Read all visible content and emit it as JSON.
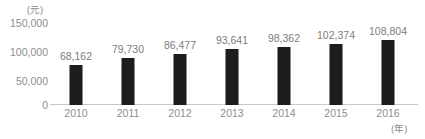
{
  "chart_data": {
    "type": "bar",
    "title": "",
    "subtitle": "",
    "xlabel": "(年)",
    "ylabel": "(元)",
    "categories": [
      "2010",
      "2011",
      "2012",
      "2013",
      "2014",
      "2015",
      "2016"
    ],
    "values": [
      68162,
      79730,
      86477,
      93641,
      98362,
      102374,
      108804
    ],
    "value_labels": [
      "68,162",
      "79,730",
      "86,477",
      "93,641",
      "98,362",
      "102,374",
      "108,804"
    ],
    "series": [
      {
        "name": "",
        "values": [
          68162,
          79730,
          86477,
          93641,
          98362,
          102374,
          108804
        ]
      }
    ],
    "ylim": [
      0,
      150000
    ],
    "yticks": [
      0,
      50000,
      100000,
      150000
    ],
    "ytick_labels": [
      "0",
      "50,000",
      "100,000",
      "150,000"
    ],
    "grid": false,
    "legend": false,
    "legend_position": "none",
    "bar_color": "#1d1d1d",
    "axis_color": "#c9c9c9",
    "label_color": "#8e8e8e"
  }
}
